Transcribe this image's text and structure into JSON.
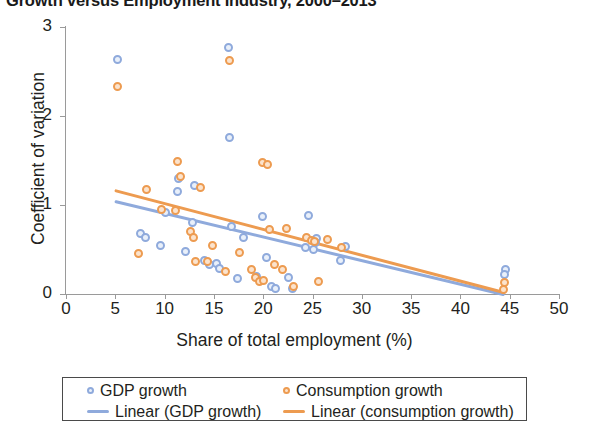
{
  "chart_data": {
    "type": "scatter",
    "title": "Growth versus Employment Industry, 2000–2013",
    "xlabel": "Share of total employment (%)",
    "ylabel": "Coefficient of variation",
    "xlim": [
      0,
      50
    ],
    "ylim": [
      0,
      3
    ],
    "xticks": [
      0,
      5,
      10,
      15,
      20,
      25,
      30,
      35,
      40,
      45,
      50
    ],
    "yticks": [
      0,
      1,
      2,
      3
    ],
    "grid": false,
    "legend_position": "bottom",
    "colors": {
      "gdp": "#8FAADC",
      "consumption": "#ED9B50",
      "axis": "#9a9a9a",
      "text": "#231f20"
    },
    "series": [
      {
        "name": "GDP growth",
        "marker": "open-circle",
        "color": "#8FAADC",
        "points": [
          [
            5.2,
            2.63
          ],
          [
            16.5,
            2.77
          ],
          [
            16.6,
            1.76
          ],
          [
            13.0,
            1.22
          ],
          [
            11.4,
            1.3
          ],
          [
            11.3,
            1.15
          ],
          [
            7.6,
            0.68
          ],
          [
            8.1,
            0.63
          ],
          [
            9.6,
            0.55
          ],
          [
            12.1,
            0.48
          ],
          [
            14.0,
            0.38
          ],
          [
            14.6,
            0.33
          ],
          [
            15.3,
            0.34
          ],
          [
            15.6,
            0.29
          ],
          [
            17.4,
            0.17
          ],
          [
            18.0,
            0.63
          ],
          [
            19.3,
            0.2
          ],
          [
            20.8,
            0.08
          ],
          [
            19.9,
            0.87
          ],
          [
            21.2,
            0.06
          ],
          [
            23.0,
            0.06
          ],
          [
            22.6,
            0.18
          ],
          [
            24.6,
            0.88
          ],
          [
            24.3,
            0.52
          ],
          [
            25.1,
            0.5
          ],
          [
            25.4,
            0.62
          ],
          [
            25.3,
            0.58
          ],
          [
            27.8,
            0.38
          ],
          [
            28.3,
            0.53
          ],
          [
            20.3,
            0.41
          ],
          [
            16.8,
            0.76
          ],
          [
            12.8,
            0.8
          ],
          [
            10.1,
            0.92
          ],
          [
            44.6,
            0.27
          ],
          [
            44.5,
            0.22
          ]
        ]
      },
      {
        "name": "Consumption growth",
        "marker": "open-circle",
        "color": "#ED9B50",
        "points": [
          [
            5.2,
            2.33
          ],
          [
            16.6,
            2.62
          ],
          [
            11.3,
            1.49
          ],
          [
            19.9,
            1.48
          ],
          [
            20.4,
            1.45
          ],
          [
            13.6,
            1.2
          ],
          [
            11.6,
            1.32
          ],
          [
            8.2,
            1.17
          ],
          [
            7.4,
            0.45
          ],
          [
            9.7,
            0.95
          ],
          [
            11.1,
            0.94
          ],
          [
            12.6,
            0.7
          ],
          [
            12.9,
            0.63
          ],
          [
            14.9,
            0.55
          ],
          [
            13.1,
            0.37
          ],
          [
            14.4,
            0.36
          ],
          [
            16.2,
            0.25
          ],
          [
            17.6,
            0.47
          ],
          [
            18.8,
            0.28
          ],
          [
            19.2,
            0.19
          ],
          [
            19.6,
            0.14
          ],
          [
            20.0,
            0.15
          ],
          [
            20.6,
            0.73
          ],
          [
            21.1,
            0.33
          ],
          [
            22.0,
            0.27
          ],
          [
            22.4,
            0.74
          ],
          [
            23.1,
            0.08
          ],
          [
            24.4,
            0.63
          ],
          [
            24.9,
            0.6
          ],
          [
            25.2,
            0.59
          ],
          [
            25.6,
            0.14
          ],
          [
            26.5,
            0.61
          ],
          [
            27.9,
            0.52
          ],
          [
            44.5,
            0.13
          ],
          [
            44.4,
            0.05
          ]
        ]
      }
    ],
    "trendlines": [
      {
        "name": "Linear (GDP growth)",
        "color": "#8FAADC",
        "x0": 5.0,
        "y0": 1.06,
        "x1": 44.6,
        "y1": 0.01
      },
      {
        "name": "Linear (consumption growth)",
        "color": "#ED9B50",
        "x0": 5.0,
        "y0": 1.18,
        "x1": 44.6,
        "y1": 0.03
      }
    ],
    "legend": [
      "GDP growth",
      "Consumption growth",
      "Linear (GDP growth)",
      "Linear (consumption growth)"
    ]
  }
}
